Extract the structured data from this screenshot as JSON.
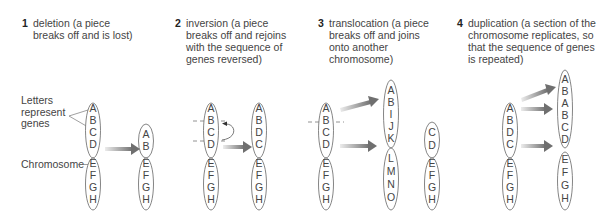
{
  "panels": [
    {
      "number": "1",
      "title": "deletion (a piece\nbreaks off and is lost)",
      "labels": {
        "genes": "Letters\nrepresent\ngenes",
        "chromosome": "Chromosome"
      },
      "before": {
        "top": [
          "A",
          "B",
          "C",
          "D"
        ],
        "bottom": [
          "E",
          "F",
          "G",
          "H"
        ]
      },
      "after": {
        "top": [
          "A",
          "B"
        ],
        "bottom": [
          "E",
          "F",
          "G",
          "H"
        ]
      }
    },
    {
      "number": "2",
      "title": "inversion (a piece\nbreaks off and rejoins\nwith the sequence of\ngenes reversed)",
      "before": {
        "top": [
          "A",
          "B",
          "C",
          "D"
        ],
        "bottom": [
          "E",
          "F",
          "G",
          "H"
        ]
      },
      "after": {
        "top": [
          "A",
          "B",
          "D",
          "C"
        ],
        "bottom": [
          "E",
          "F",
          "G",
          "H"
        ]
      }
    },
    {
      "number": "3",
      "title": "translocation (a piece\nbreaks off and joins\nonto another\nchromosome)",
      "before": {
        "top": [
          "A",
          "B",
          "C",
          "D"
        ],
        "bottom": [
          "E",
          "F",
          "G",
          "H"
        ]
      },
      "after_recipient": {
        "top": [
          "A",
          "B",
          "I",
          "J",
          "K"
        ],
        "bottom": [
          "L",
          "M",
          "N",
          "O"
        ]
      },
      "after_donor": {
        "top": [
          "C",
          "D"
        ],
        "bottom": [
          "E",
          "F",
          "G",
          "H"
        ]
      }
    },
    {
      "number": "4",
      "title": "duplication (a section of the\nchromosome replicates, so\nthat the sequence of genes\nis repeated)",
      "before": {
        "top": [
          "A",
          "B",
          "D",
          "C"
        ],
        "bottom": [
          "E",
          "F",
          "G",
          "H"
        ]
      },
      "after": {
        "top": [
          "A",
          "B",
          "A",
          "B",
          "C",
          "D"
        ],
        "bottom": [
          "E",
          "F",
          "G",
          "H"
        ]
      }
    }
  ],
  "colors": {
    "arrow_start": "#e6e6e6",
    "arrow_end": "#777777",
    "outline": "#666666"
  }
}
